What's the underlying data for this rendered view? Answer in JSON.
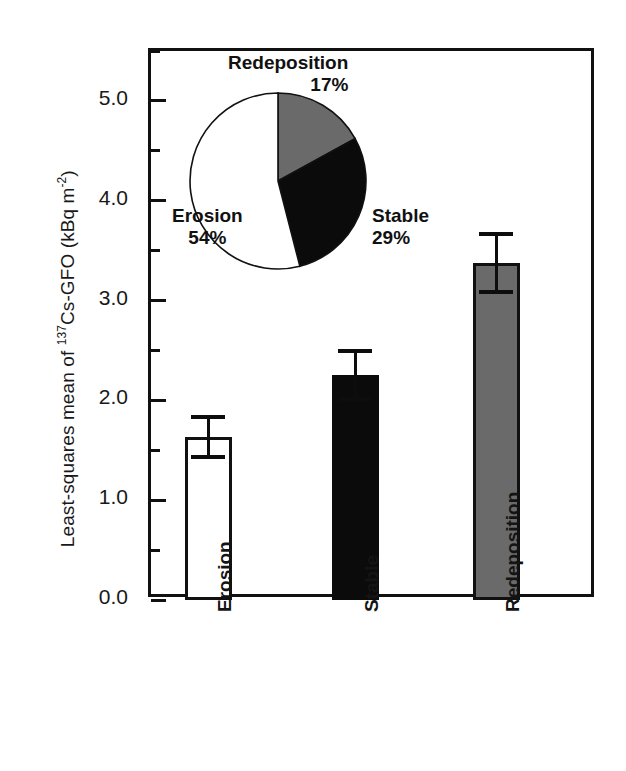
{
  "chart_data": {
    "type": "bar",
    "title": "",
    "xlabel": "",
    "ylabel": "Least-squares mean of ¹³⁷Cs-GFO (kBq m⁻²)",
    "ylabel_parts": {
      "prefix": "Least-squares mean of ",
      "sup1": "137",
      "mid": "Cs-GFO (kBq m",
      "sup2": "-2",
      "suffix": ")"
    },
    "categories": [
      "Erosion",
      "Stable",
      "Redeposition"
    ],
    "values": [
      1.63,
      2.25,
      3.38
    ],
    "errors": [
      0.2,
      0.24,
      0.29
    ],
    "bar_styles": [
      "white",
      "black",
      "gray"
    ],
    "ylim": [
      0.0,
      5.5
    ],
    "ytick_major": [
      "0.0",
      "1.0",
      "2.0",
      "3.0",
      "4.0",
      "5.0"
    ],
    "ytick_major_values": [
      0.0,
      1.0,
      2.0,
      3.0,
      4.0,
      5.0
    ],
    "ytick_minor_values": [
      0.5,
      1.5,
      2.5,
      3.5,
      4.5,
      5.5
    ],
    "grid": false,
    "legend": "none",
    "colors": {
      "erosion": "#ffffff",
      "stable": "#0b0b0b",
      "redeposition": "#6a6a6a",
      "axis": "#111111"
    }
  },
  "inset_pie": {
    "type": "pie",
    "title": "",
    "labels": [
      "Erosion",
      "Redeposition",
      "Stable"
    ],
    "values": [
      54,
      29,
      17
    ],
    "slices": [
      {
        "name": "Erosion",
        "percent_text": "54%",
        "percent": 54,
        "fill": "#ffffff"
      },
      {
        "name": "Redeposition",
        "percent_text": "17%",
        "percent": 17,
        "fill": "#6a6a6a"
      },
      {
        "name": "Stable",
        "percent_text": "29%",
        "percent": 29,
        "fill": "#0b0b0b"
      }
    ]
  }
}
